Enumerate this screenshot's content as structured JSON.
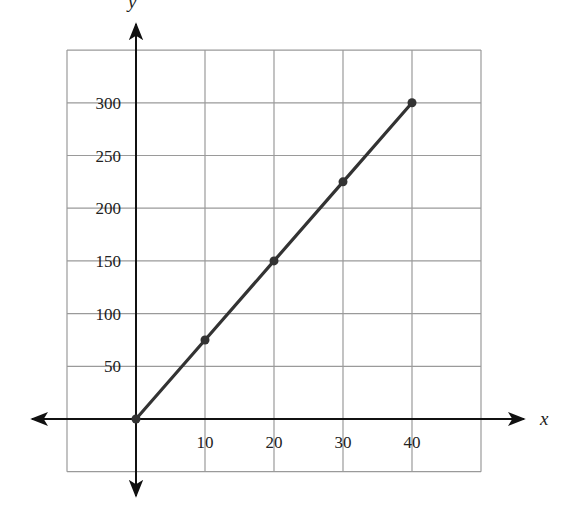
{
  "chart_data": {
    "type": "line",
    "title": "",
    "xlabel": "x",
    "ylabel": "y",
    "x": [
      0,
      10,
      20,
      30,
      40
    ],
    "series": [
      {
        "name": "line",
        "values": [
          0,
          75,
          150,
          225,
          300
        ],
        "color": "#333333",
        "markers": true
      }
    ],
    "x_ticks": [
      "10",
      "20",
      "30",
      "40"
    ],
    "y_ticks": [
      "50",
      "100",
      "150",
      "200",
      "250",
      "300"
    ],
    "xlim": [
      -10,
      50
    ],
    "ylim": [
      -50,
      350
    ],
    "grid": true,
    "legend": "none"
  },
  "colors": {
    "grid": "#9a9a9a",
    "axis": "#111111",
    "line": "#333333",
    "text": "#222222"
  }
}
